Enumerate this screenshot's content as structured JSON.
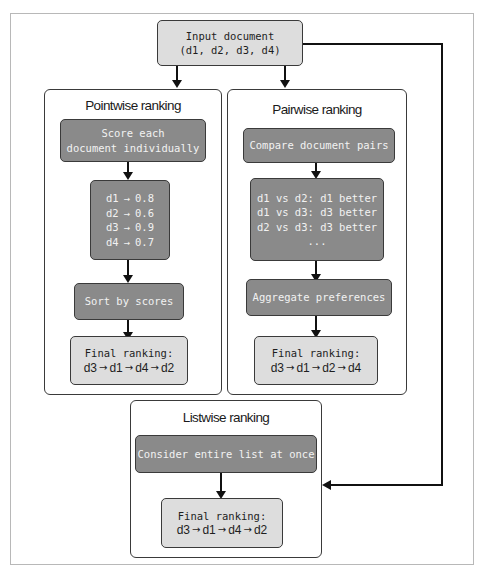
{
  "input": {
    "line1": "Input document",
    "line2": "(d1, d2, d3, d4)"
  },
  "pointwise": {
    "title": "Pointwise ranking",
    "step1": {
      "line1": "Score each",
      "line2": "document individually"
    },
    "scores": [
      {
        "doc": "d1",
        "arrow": "→",
        "score": "0.8"
      },
      {
        "doc": "d2",
        "arrow": "→",
        "score": "0.6"
      },
      {
        "doc": "d3",
        "arrow": "→",
        "score": "0.9"
      },
      {
        "doc": "d4",
        "arrow": "→",
        "score": "0.7"
      }
    ],
    "step3": "Sort by scores",
    "final": {
      "label": "Final ranking:",
      "order": [
        "d3",
        "d1",
        "d4",
        "d2"
      ],
      "arrow": "→"
    }
  },
  "pairwise": {
    "title": "Pairwise ranking",
    "step1": "Compare document pairs",
    "comparisons": [
      "d1 vs d2: d1 better",
      "d1 vs d3: d3 better",
      "d2 vs d3: d3 better",
      "..."
    ],
    "step3": "Aggregate preferences",
    "final": {
      "label": "Final ranking:",
      "order": [
        "d3",
        "d1",
        "d2",
        "d4"
      ],
      "arrow": "→"
    }
  },
  "listwise": {
    "title": "Listwise ranking",
    "step1": "Consider entire list at once",
    "final": {
      "label": "Final ranking:",
      "order": [
        "d3",
        "d1",
        "d4",
        "d2"
      ],
      "arrow": "→"
    }
  },
  "colors": {
    "dark_box": "#8a8a8a",
    "light_box": "#dddddd",
    "border": "#3a3a3a",
    "frame": "#b8b8b8"
  }
}
